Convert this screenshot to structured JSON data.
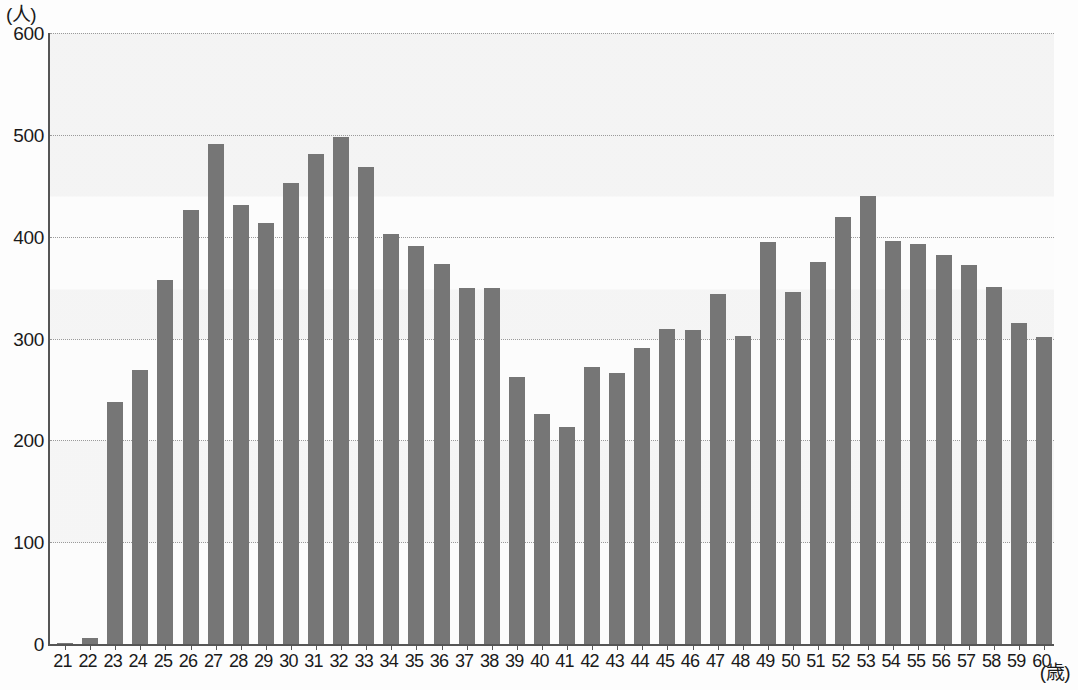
{
  "chart_data": {
    "type": "bar",
    "title": "",
    "subtitle": "",
    "xlabel": "(歳)",
    "ylabel": "(人)",
    "xlim": [
      21,
      60
    ],
    "ylim": [
      0,
      600
    ],
    "yticks": [
      0,
      100,
      200,
      300,
      400,
      500,
      600
    ],
    "ytick_labels": [
      "0",
      "100",
      "200",
      "300",
      "400",
      "500",
      "600"
    ],
    "grid": true,
    "grid_axis": "y",
    "grid_style": "dotted",
    "legend": null,
    "legend_position": "none",
    "bar_color": "#767676",
    "categories": [
      "21",
      "22",
      "23",
      "24",
      "25",
      "26",
      "27",
      "28",
      "29",
      "30",
      "31",
      "32",
      "33",
      "34",
      "35",
      "36",
      "37",
      "38",
      "39",
      "40",
      "41",
      "42",
      "43",
      "44",
      "45",
      "46",
      "47",
      "48",
      "49",
      "50",
      "51",
      "52",
      "53",
      "54",
      "55",
      "56",
      "57",
      "58",
      "59",
      "60"
    ],
    "values": [
      1,
      6,
      238,
      269,
      357,
      426,
      491,
      431,
      413,
      453,
      481,
      498,
      468,
      403,
      391,
      373,
      350,
      350,
      262,
      226,
      213,
      272,
      266,
      291,
      309,
      308,
      344,
      302,
      395,
      346,
      375,
      419,
      440,
      396,
      393,
      382,
      372,
      351,
      315,
      301
    ],
    "series_name": "人数"
  },
  "axes": {
    "y_unit_caption": "(人)",
    "x_unit_caption": "(歳)"
  }
}
